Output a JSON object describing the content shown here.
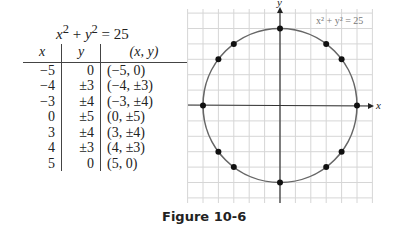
{
  "table": {
    "title": {
      "lhs_x": "x",
      "lhs_y": "y",
      "exp": "2",
      "rest": "= 25",
      "plus": "+"
    },
    "headers": [
      "x",
      "y",
      "(x, y)"
    ],
    "rows": [
      [
        "−5",
        "0",
        "(−5, 0)"
      ],
      [
        "−4",
        "±3",
        "(−4, ±3)"
      ],
      [
        "−3",
        "±4",
        "(−3, ±4)"
      ],
      [
        "0",
        "±5",
        "(0, ±5)"
      ],
      [
        "3",
        "±4",
        "(3, ±4)"
      ],
      [
        "4",
        "±3",
        "(4, ±3)"
      ],
      [
        "5",
        "0",
        "(5, 0)"
      ]
    ]
  },
  "graph": {
    "x_axis_label": "x",
    "y_axis_label": "y",
    "equation_label": "x² + y² = 25"
  },
  "caption": "Figure 10-6",
  "chart_data": {
    "type": "scatter",
    "title": "x² + y² = 25",
    "xlabel": "x",
    "ylabel": "y",
    "xlim": [
      -6,
      6
    ],
    "ylim": [
      -6,
      6.5
    ],
    "grid": true,
    "curve": {
      "shape": "circle",
      "center": [
        0,
        0
      ],
      "radius": 5
    },
    "points": [
      [
        -5,
        0
      ],
      [
        -4,
        3
      ],
      [
        -4,
        -3
      ],
      [
        -3,
        4
      ],
      [
        -3,
        -4
      ],
      [
        0,
        5
      ],
      [
        0,
        -5
      ],
      [
        3,
        4
      ],
      [
        3,
        -4
      ],
      [
        4,
        3
      ],
      [
        4,
        -3
      ],
      [
        5,
        0
      ]
    ],
    "annotations": [
      "x² + y² = 25"
    ],
    "caption": "Figure 10-6"
  }
}
